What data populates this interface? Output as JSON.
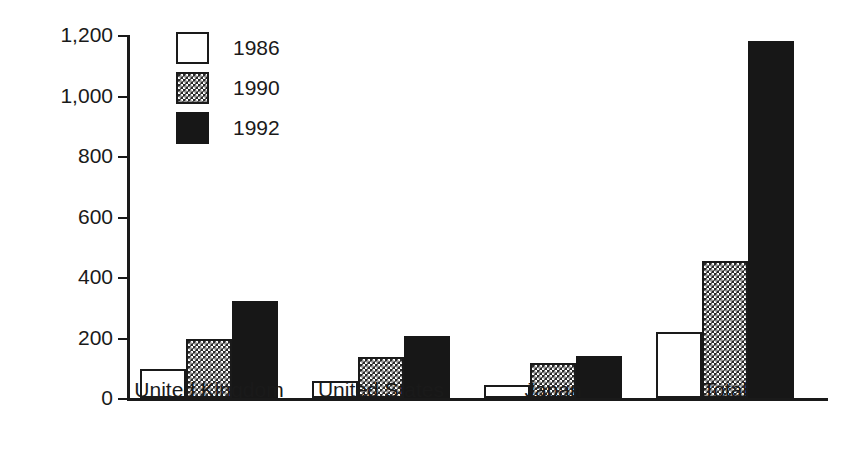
{
  "chart_data": {
    "type": "bar",
    "title": "",
    "subtitle": "",
    "xlabel": "",
    "ylabel": "US$ bn",
    "ylim": [
      0,
      1200
    ],
    "yticks": [
      0,
      200,
      400,
      600,
      800,
      1000,
      1200
    ],
    "ytick_labels": [
      "0",
      "200",
      "400",
      "600",
      "800",
      "1,000",
      "1,200"
    ],
    "grid": false,
    "legend_position": "top-left",
    "categories": [
      "United Kingdom",
      "United States",
      "Japan",
      "Total"
    ],
    "series": [
      {
        "name": "1986",
        "fill": "white",
        "color": "#ffffff",
        "values": [
          96,
          57,
          42,
          218
        ]
      },
      {
        "name": "1990",
        "fill": "checkered",
        "color": "#2a2a2a",
        "values": [
          195,
          135,
          117,
          453
        ]
      },
      {
        "name": "1992",
        "fill": "solid-black",
        "color": "#171717",
        "values": [
          320,
          205,
          140,
          1180
        ]
      }
    ]
  },
  "axis": {
    "y_title": "US$ bn",
    "ticks": [
      {
        "value": 1200,
        "label": "1,200"
      },
      {
        "value": 1000,
        "label": "1,000"
      },
      {
        "value": 800,
        "label": "800"
      },
      {
        "value": 600,
        "label": "600"
      },
      {
        "value": 400,
        "label": "400"
      },
      {
        "value": 200,
        "label": "200"
      },
      {
        "value": 0,
        "label": "0"
      }
    ]
  },
  "legend": {
    "items": [
      {
        "label": "1986",
        "swatch": "legend-swatch-1986"
      },
      {
        "label": "1990",
        "swatch": "legend-swatch-1990"
      },
      {
        "label": "1992",
        "swatch": "legend-swatch-1992"
      }
    ]
  },
  "colors": {
    "ink": "#1a1a1a",
    "series_1986": "#ffffff",
    "series_1990": "#2a2a2a",
    "series_1992": "#171717",
    "background": "#ffffff"
  }
}
